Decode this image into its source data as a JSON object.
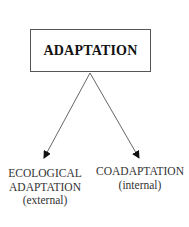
{
  "diagram": {
    "root": {
      "label": "ADAPTATION"
    },
    "children": [
      {
        "lines": [
          "ECOLOGICAL",
          "ADAPTATION",
          "(external)"
        ]
      },
      {
        "lines": [
          "COADAPTATION",
          "(internal)"
        ]
      }
    ],
    "colors": {
      "line": "#555555",
      "text": "#222222"
    }
  }
}
